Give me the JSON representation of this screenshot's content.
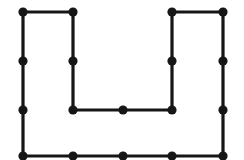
{
  "figure": {
    "kind": "rectilinear-polygon-with-marked-points",
    "shape_name": "U-shaped hexomino outline",
    "canvas": {
      "width": 244,
      "height": 160,
      "background": "#ffffff"
    },
    "style": {
      "stroke_color": "#161616",
      "stroke_width": 3.2,
      "dot_color": "#161616",
      "dot_radius": 4.6,
      "line_join": "miter"
    },
    "outline_points": [
      {
        "name": "top-left-outer",
        "x": 23,
        "y": 12
      },
      {
        "name": "top-inner-left",
        "x": 73,
        "y": 12
      },
      {
        "name": "notch-bottom-left",
        "x": 73,
        "y": 110
      },
      {
        "name": "notch-bottom-right",
        "x": 172,
        "y": 110
      },
      {
        "name": "top-inner-right",
        "x": 172,
        "y": 12
      },
      {
        "name": "top-right-outer",
        "x": 223,
        "y": 12
      },
      {
        "name": "bottom-right-outer",
        "x": 223,
        "y": 156
      },
      {
        "name": "bottom-left-outer",
        "x": 23,
        "y": 156
      }
    ],
    "marked_points": [
      {
        "name": "corner-top-left",
        "x": 23,
        "y": 12,
        "role": "vertex"
      },
      {
        "name": "corner-top-inner-left",
        "x": 73,
        "y": 12,
        "role": "vertex"
      },
      {
        "name": "corner-top-inner-right",
        "x": 172,
        "y": 12,
        "role": "vertex"
      },
      {
        "name": "corner-top-right",
        "x": 223,
        "y": 12,
        "role": "vertex"
      },
      {
        "name": "mid-left-edge-upper",
        "x": 23,
        "y": 61,
        "role": "edge-midpoint"
      },
      {
        "name": "mid-notch-left-edge",
        "x": 73,
        "y": 61,
        "role": "edge-midpoint"
      },
      {
        "name": "mid-notch-right-edge",
        "x": 172,
        "y": 61,
        "role": "edge-midpoint"
      },
      {
        "name": "mid-right-edge-upper",
        "x": 223,
        "y": 61,
        "role": "edge-midpoint"
      },
      {
        "name": "mid-left-edge-lower",
        "x": 23,
        "y": 110,
        "role": "edge-midpoint"
      },
      {
        "name": "corner-notch-bottom-left",
        "x": 73,
        "y": 110,
        "role": "vertex"
      },
      {
        "name": "mid-notch-bottom",
        "x": 123,
        "y": 110,
        "role": "edge-midpoint"
      },
      {
        "name": "corner-notch-bottom-right",
        "x": 172,
        "y": 110,
        "role": "vertex"
      },
      {
        "name": "mid-right-edge-lower",
        "x": 223,
        "y": 110,
        "role": "edge-midpoint"
      },
      {
        "name": "corner-bottom-left",
        "x": 23,
        "y": 156,
        "role": "vertex"
      },
      {
        "name": "mid-bottom-edge-left",
        "x": 73,
        "y": 156,
        "role": "edge-midpoint"
      },
      {
        "name": "mid-bottom-edge-center",
        "x": 123,
        "y": 156,
        "role": "edge-midpoint"
      },
      {
        "name": "mid-bottom-edge-right",
        "x": 172,
        "y": 156,
        "role": "edge-midpoint"
      },
      {
        "name": "corner-bottom-right",
        "x": 223,
        "y": 156,
        "role": "vertex"
      }
    ]
  }
}
